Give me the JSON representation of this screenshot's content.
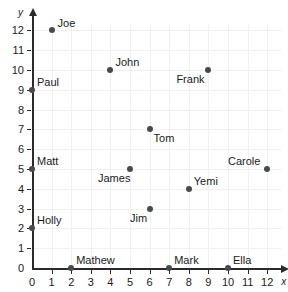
{
  "chart_data": {
    "type": "scatter",
    "title": "",
    "xlabel": "x",
    "ylabel": "y",
    "xlim": [
      0,
      12
    ],
    "ylim": [
      0,
      12
    ],
    "grid": true,
    "legend": "none",
    "xticks": [
      "0",
      "1",
      "2",
      "3",
      "4",
      "5",
      "6",
      "7",
      "8",
      "9",
      "10",
      "11",
      "12"
    ],
    "yticks": [
      "0",
      "1",
      "2",
      "3",
      "4",
      "5",
      "6",
      "7",
      "8",
      "9",
      "10",
      "11",
      "12"
    ],
    "points": [
      {
        "label": "Joe",
        "x": 1,
        "y": 12,
        "label_pos": "right"
      },
      {
        "label": "Paul",
        "x": 0,
        "y": 9,
        "label_pos": "above-right"
      },
      {
        "label": "John",
        "x": 4,
        "y": 10,
        "label_pos": "above-right"
      },
      {
        "label": "Frank",
        "x": 9,
        "y": 10,
        "label_pos": "below-left"
      },
      {
        "label": "Tom",
        "x": 6,
        "y": 7,
        "label_pos": "below-right"
      },
      {
        "label": "Matt",
        "x": 0,
        "y": 5,
        "label_pos": "above-right"
      },
      {
        "label": "James",
        "x": 5,
        "y": 5,
        "label_pos": "below-left"
      },
      {
        "label": "Carole",
        "x": 12,
        "y": 5,
        "label_pos": "above-left"
      },
      {
        "label": "Yemi",
        "x": 8,
        "y": 4,
        "label_pos": "above-right"
      },
      {
        "label": "Jim",
        "x": 6,
        "y": 3,
        "label_pos": "below-left"
      },
      {
        "label": "Holly",
        "x": 0,
        "y": 2,
        "label_pos": "above-right"
      },
      {
        "label": "Mathew",
        "x": 2,
        "y": 0,
        "label_pos": "above-right"
      },
      {
        "label": "Mark",
        "x": 7,
        "y": 0,
        "label_pos": "above-right"
      },
      {
        "label": "Ella",
        "x": 10,
        "y": 0,
        "label_pos": "above-right"
      }
    ],
    "colors": {
      "marker": "#4a4a4a",
      "axis": "#2b2b2b",
      "grid": "#f0f0f0",
      "text": "#1a1a1a"
    }
  }
}
